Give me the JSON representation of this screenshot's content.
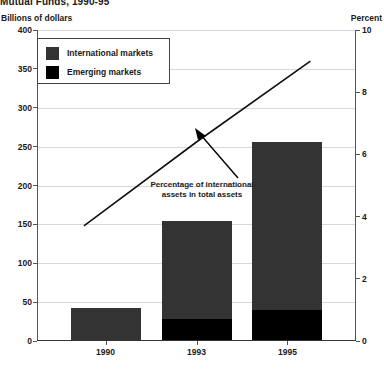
{
  "chart_data": {
    "type": "bar",
    "title": "Mutual Funds, 1990-95",
    "categories": [
      "1990",
      "1993",
      "1995"
    ],
    "series": [
      {
        "name": "International markets",
        "values": [
          41,
          126,
          217
        ],
        "color": "#333333"
      },
      {
        "name": "Emerging markets",
        "values": [
          0,
          27,
          38
        ],
        "color": "#000000"
      }
    ],
    "stacked_totals": [
      41,
      153,
      255
    ],
    "line_series": {
      "name": "Percentage of international assets in total assets",
      "x": [
        "1990",
        "1993",
        "1995"
      ],
      "values": [
        3.7,
        6.4,
        9.0
      ],
      "axis": "right",
      "color": "#111111"
    },
    "ylabel": "Billions of dollars",
    "ylabel_right": "Percent",
    "xlabel": "",
    "ylim": [
      0,
      400
    ],
    "ylim_right": [
      0,
      10
    ],
    "yticks": [
      0,
      50,
      100,
      150,
      200,
      250,
      300,
      350,
      400
    ],
    "yticks_right": [
      0,
      2,
      4,
      6,
      8,
      10
    ],
    "grid": true,
    "legend_position": "upper-left",
    "annotations": [
      {
        "text": "Percentage of international assets in total assets",
        "points_to": "line"
      }
    ]
  },
  "axes": {
    "left_unit": "Billions of dollars",
    "right_unit": "Percent",
    "left_ticks": [
      "400",
      "350",
      "300",
      "250",
      "200",
      "150",
      "100",
      "50",
      "0"
    ],
    "right_ticks": [
      "10",
      "8",
      "6",
      "4",
      "2",
      "0"
    ],
    "x_ticks": [
      "1990",
      "1993",
      "1995"
    ]
  },
  "legend": {
    "items": [
      {
        "label": "International markets",
        "color": "#333333"
      },
      {
        "label": "Emerging markets",
        "color": "#000000"
      }
    ]
  },
  "annotation": {
    "line1": "Percentage of international",
    "line2": "assets in total assets"
  },
  "title": "Mutual Funds, 1990-95"
}
